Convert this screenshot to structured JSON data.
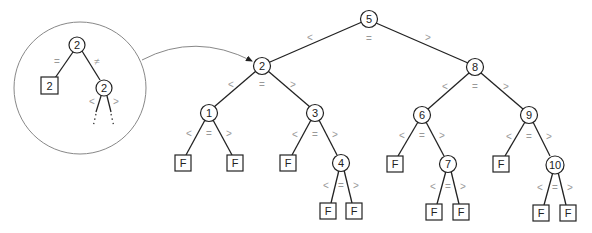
{
  "diagram": {
    "type": "ternary-search-tree",
    "nodes": {
      "n5": {
        "label": "5"
      },
      "n2": {
        "label": "2"
      },
      "n8": {
        "label": "8"
      },
      "n1": {
        "label": "1"
      },
      "n3": {
        "label": "3"
      },
      "n4": {
        "label": "4"
      },
      "n6": {
        "label": "6"
      },
      "n7": {
        "label": "7"
      },
      "n9": {
        "label": "9"
      },
      "n10": {
        "label": "10"
      }
    },
    "leaf_label": "F",
    "comparators": {
      "lt": "<",
      "eq": "=",
      "gt": ">",
      "neq": "≠"
    },
    "inset": {
      "root_label": "2",
      "eq_leaf_label": "2",
      "neq_child_label": "2",
      "eq_symbol": "=",
      "neq_symbol": "≠",
      "lt_symbol": "<",
      "gt_symbol": ">"
    }
  }
}
